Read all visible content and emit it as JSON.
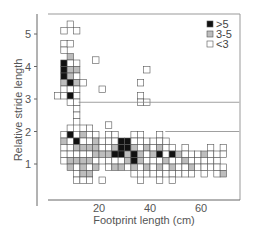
{
  "chart_data": {
    "type": "heatmap",
    "title": "",
    "xlabel": "Footprint length (cm)",
    "ylabel": "Relative stride length",
    "xticks": [
      20,
      40,
      60
    ],
    "yticks": [
      1,
      2,
      3,
      4,
      5
    ],
    "xlim": [
      0,
      75
    ],
    "ylim": [
      0,
      5.8
    ],
    "cell_size": {
      "x_cm": 2.5,
      "y": 0.2
    },
    "legend": [
      {
        "label": ">5",
        "color": "#111111",
        "level": 2
      },
      {
        "label": "3-5",
        "color": "#bdbdbd",
        "level": 1
      },
      {
        "label": "<3",
        "color": "#ffffff",
        "level": 0
      }
    ],
    "reference_lines": [
      {
        "y": 2.9,
        "x_from": 12,
        "x_to": 75
      },
      {
        "y": 2.0,
        "x_from": 46,
        "x_to": 75
      }
    ],
    "columns_note": "cells listed as [x_start_cm, y_bottom, level]; level 0=<3, 1=3-5, 2=>5",
    "cells": [
      [
        2.5,
        3.0,
        0
      ],
      [
        5,
        5.0,
        0
      ],
      [
        5,
        4.6,
        0
      ],
      [
        5,
        4.4,
        0
      ],
      [
        5,
        4.0,
        2
      ],
      [
        5,
        3.8,
        2
      ],
      [
        5,
        3.6,
        2
      ],
      [
        5,
        3.4,
        1
      ],
      [
        5,
        3.2,
        0
      ],
      [
        5,
        3.0,
        0
      ],
      [
        5,
        1.8,
        0
      ],
      [
        5,
        1.6,
        1
      ],
      [
        5,
        1.4,
        0
      ],
      [
        5,
        1.2,
        0
      ],
      [
        5,
        1.0,
        0
      ],
      [
        7.5,
        5.2,
        0
      ],
      [
        7.5,
        4.6,
        0
      ],
      [
        7.5,
        4.2,
        1
      ],
      [
        7.5,
        4.0,
        0
      ],
      [
        7.5,
        3.8,
        1
      ],
      [
        7.5,
        3.6,
        1
      ],
      [
        7.5,
        3.4,
        2
      ],
      [
        7.5,
        3.2,
        0
      ],
      [
        7.5,
        3.0,
        2
      ],
      [
        7.5,
        2.8,
        0
      ],
      [
        7.5,
        2.0,
        0
      ],
      [
        7.5,
        1.8,
        2
      ],
      [
        7.5,
        1.6,
        0
      ],
      [
        7.5,
        1.4,
        0
      ],
      [
        7.5,
        1.2,
        0
      ],
      [
        7.5,
        1.0,
        1
      ],
      [
        7.5,
        0.8,
        1
      ],
      [
        10,
        5.0,
        0
      ],
      [
        10,
        4.0,
        0
      ],
      [
        10,
        3.8,
        1
      ],
      [
        10,
        3.6,
        0
      ],
      [
        10,
        3.4,
        1
      ],
      [
        10,
        3.2,
        0
      ],
      [
        10,
        3.0,
        0
      ],
      [
        10,
        2.8,
        0
      ],
      [
        10,
        2.6,
        0
      ],
      [
        10,
        2.4,
        0
      ],
      [
        10,
        2.2,
        0
      ],
      [
        10,
        1.8,
        0
      ],
      [
        10,
        1.6,
        2
      ],
      [
        10,
        1.4,
        1
      ],
      [
        10,
        1.2,
        0
      ],
      [
        10,
        1.0,
        1
      ],
      [
        10,
        0.8,
        0
      ],
      [
        10,
        0.6,
        0
      ],
      [
        10,
        0.4,
        0
      ],
      [
        12.5,
        3.4,
        0
      ],
      [
        12.5,
        2.0,
        0
      ],
      [
        12.5,
        1.8,
        1
      ],
      [
        12.5,
        1.6,
        0
      ],
      [
        12.5,
        1.4,
        1
      ],
      [
        12.5,
        1.2,
        0
      ],
      [
        12.5,
        1.0,
        1
      ],
      [
        12.5,
        0.8,
        1
      ],
      [
        12.5,
        0.6,
        1
      ],
      [
        12.5,
        0.4,
        0
      ],
      [
        15,
        2.0,
        0
      ],
      [
        15,
        1.8,
        0
      ],
      [
        15,
        1.6,
        0
      ],
      [
        15,
        1.4,
        1
      ],
      [
        15,
        1.2,
        0
      ],
      [
        15,
        1.0,
        1
      ],
      [
        15,
        0.8,
        0
      ],
      [
        15,
        0.6,
        1
      ],
      [
        15,
        0.4,
        0
      ],
      [
        17.5,
        4.1,
        0
      ],
      [
        17.5,
        1.8,
        0
      ],
      [
        17.5,
        1.6,
        1
      ],
      [
        17.5,
        1.4,
        1
      ],
      [
        17.5,
        1.2,
        1
      ],
      [
        17.5,
        1.0,
        0
      ],
      [
        17.5,
        0.8,
        1
      ],
      [
        20,
        3.2,
        0
      ],
      [
        20,
        1.6,
        0
      ],
      [
        20,
        1.4,
        0
      ],
      [
        20,
        1.2,
        1
      ],
      [
        20,
        1.0,
        0
      ],
      [
        20,
        0.4,
        0
      ],
      [
        22.5,
        2.1,
        0
      ],
      [
        22.5,
        1.8,
        0
      ],
      [
        22.5,
        1.6,
        0
      ],
      [
        22.5,
        1.4,
        0
      ],
      [
        22.5,
        1.2,
        1
      ],
      [
        22.5,
        1.0,
        0
      ],
      [
        22.5,
        0.8,
        0
      ],
      [
        25,
        1.8,
        0
      ],
      [
        25,
        1.6,
        0
      ],
      [
        25,
        1.4,
        1
      ],
      [
        25,
        1.2,
        2
      ],
      [
        25,
        1.0,
        0
      ],
      [
        25,
        0.8,
        1
      ],
      [
        27.5,
        1.6,
        2
      ],
      [
        27.5,
        1.4,
        2
      ],
      [
        27.5,
        1.2,
        2
      ],
      [
        27.5,
        1.0,
        0
      ],
      [
        27.5,
        0.8,
        1
      ],
      [
        30,
        1.6,
        2
      ],
      [
        30,
        1.4,
        2
      ],
      [
        30,
        1.2,
        1
      ],
      [
        30,
        1.0,
        1
      ],
      [
        30,
        0.8,
        0
      ],
      [
        32.5,
        1.8,
        0
      ],
      [
        32.5,
        1.6,
        0
      ],
      [
        32.5,
        1.4,
        1
      ],
      [
        32.5,
        1.2,
        2
      ],
      [
        32.5,
        1.0,
        2
      ],
      [
        32.5,
        0.8,
        1
      ],
      [
        32.5,
        0.6,
        0
      ],
      [
        35,
        3.4,
        0
      ],
      [
        35,
        3.0,
        0
      ],
      [
        35,
        2.8,
        0
      ],
      [
        35,
        1.8,
        0
      ],
      [
        35,
        1.6,
        0
      ],
      [
        35,
        1.4,
        0
      ],
      [
        35,
        1.2,
        1
      ],
      [
        35,
        1.0,
        1
      ],
      [
        35,
        0.8,
        0
      ],
      [
        35,
        0.4,
        0
      ],
      [
        37.5,
        3.8,
        0
      ],
      [
        37.5,
        2.8,
        0
      ],
      [
        37.5,
        1.6,
        0
      ],
      [
        37.5,
        1.4,
        1
      ],
      [
        37.5,
        1.2,
        0
      ],
      [
        37.5,
        1.0,
        0
      ],
      [
        37.5,
        0.8,
        1
      ],
      [
        37.5,
        0.6,
        0
      ],
      [
        40,
        1.6,
        0
      ],
      [
        40,
        1.4,
        0
      ],
      [
        40,
        1.2,
        1
      ],
      [
        40,
        1.0,
        0
      ],
      [
        40,
        0.8,
        0
      ],
      [
        40,
        0.6,
        0
      ],
      [
        42.5,
        1.8,
        0
      ],
      [
        42.5,
        1.6,
        0
      ],
      [
        42.5,
        1.4,
        1
      ],
      [
        42.5,
        1.2,
        2
      ],
      [
        42.5,
        1.0,
        0
      ],
      [
        42.5,
        0.8,
        1
      ],
      [
        42.5,
        0.6,
        0
      ],
      [
        42.5,
        0.4,
        0
      ],
      [
        45,
        1.6,
        0
      ],
      [
        45,
        1.4,
        0
      ],
      [
        45,
        1.2,
        0
      ],
      [
        45,
        1.0,
        1
      ],
      [
        45,
        0.8,
        0
      ],
      [
        45,
        0.6,
        0
      ],
      [
        47.5,
        1.4,
        0
      ],
      [
        47.5,
        1.2,
        2
      ],
      [
        47.5,
        1.0,
        0
      ],
      [
        47.5,
        0.8,
        1
      ],
      [
        47.5,
        0.6,
        0
      ],
      [
        47.5,
        0.4,
        0
      ],
      [
        50,
        1.2,
        1
      ],
      [
        50,
        1.0,
        0
      ],
      [
        50,
        0.8,
        0
      ],
      [
        50,
        0.6,
        0
      ],
      [
        52.5,
        1.4,
        0
      ],
      [
        52.5,
        1.2,
        0
      ],
      [
        52.5,
        1.0,
        1
      ],
      [
        52.5,
        0.8,
        0
      ],
      [
        52.5,
        0.6,
        0
      ],
      [
        55,
        1.2,
        0
      ],
      [
        55,
        1.0,
        0
      ],
      [
        55,
        0.8,
        1
      ],
      [
        55,
        0.6,
        0
      ],
      [
        57.5,
        1.2,
        0
      ],
      [
        57.5,
        1.0,
        0
      ],
      [
        57.5,
        0.8,
        0
      ],
      [
        60,
        1.2,
        1
      ],
      [
        60,
        1.0,
        0
      ],
      [
        60,
        0.8,
        0
      ],
      [
        60,
        0.6,
        0
      ],
      [
        62.5,
        1.4,
        0
      ],
      [
        62.5,
        1.2,
        0
      ],
      [
        62.5,
        1.0,
        0
      ],
      [
        62.5,
        0.8,
        0
      ],
      [
        65,
        1.2,
        0
      ],
      [
        65,
        1.0,
        0
      ],
      [
        65,
        0.8,
        0
      ],
      [
        65,
        0.6,
        0
      ],
      [
        67.5,
        1.4,
        0
      ],
      [
        67.5,
        1.2,
        0
      ],
      [
        67.5,
        0.8,
        0
      ],
      [
        67.5,
        0.6,
        1
      ]
    ]
  }
}
